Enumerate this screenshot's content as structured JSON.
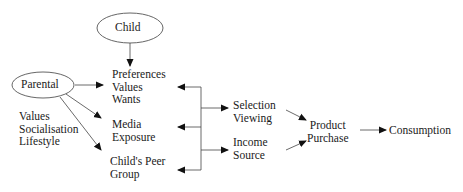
{
  "diagram": {
    "nodes": {
      "child": {
        "label": "Child"
      },
      "parental": {
        "label": "Parental"
      },
      "parental_factors": {
        "lines": [
          "Values",
          "Socialisation",
          "Lifestyle"
        ]
      },
      "preferences": {
        "lines": [
          "Preferences",
          "Values",
          "Wants"
        ]
      },
      "media": {
        "lines": [
          "Media",
          "Exposure"
        ]
      },
      "peer": {
        "lines": [
          "Child's Peer",
          "Group"
        ]
      },
      "selection": {
        "lines": [
          "Selection",
          "Viewing"
        ]
      },
      "income": {
        "lines": [
          "Income",
          "Source"
        ]
      },
      "product": {
        "lines": [
          "Product",
          "Purchase"
        ]
      },
      "consumption": {
        "label": "Consumption"
      }
    },
    "edges": [
      {
        "from": "Child",
        "to": "Preferences Values Wants"
      },
      {
        "from": "Parental",
        "to": "Preferences Values Wants"
      },
      {
        "from": "Parental",
        "to": "Media Exposure"
      },
      {
        "from": "Parental",
        "to": "Child's Peer Group"
      },
      {
        "from": "Bracket",
        "to": "Preferences Values Wants"
      },
      {
        "from": "Bracket",
        "to": "Media Exposure"
      },
      {
        "from": "Bracket",
        "to": "Child's Peer Group"
      },
      {
        "from": "Bracket",
        "to": "Selection Viewing"
      },
      {
        "from": "Bracket",
        "to": "Income Source"
      },
      {
        "from": "Selection Viewing",
        "to": "Product Purchase"
      },
      {
        "from": "Income Source",
        "to": "Product Purchase"
      },
      {
        "from": "Product Purchase",
        "to": "Consumption"
      }
    ],
    "colors": {
      "line": "#333333",
      "text": "#1a1a1a",
      "background": "#ffffff"
    }
  }
}
